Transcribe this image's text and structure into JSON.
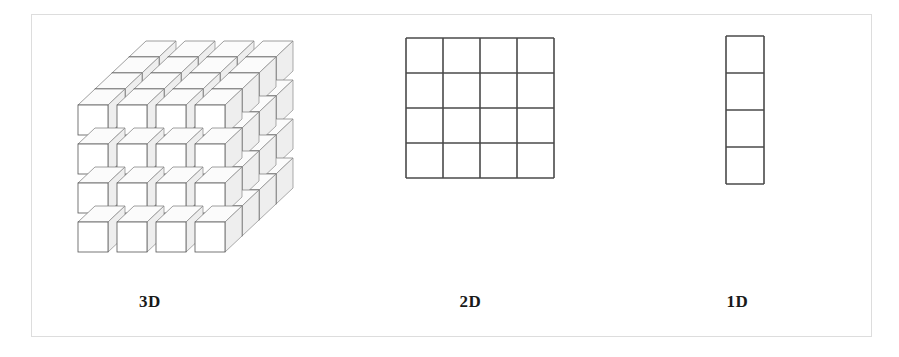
{
  "figure": {
    "background_color": "#ffffff",
    "frame": {
      "name": "outer-border",
      "color": "#dddddd",
      "x": 31,
      "y": 14,
      "width": 841,
      "height": 323
    },
    "panels": [
      {
        "id": "3d",
        "caption": "3D",
        "shape": "cube-array",
        "dims": [
          4,
          4,
          4
        ],
        "cell_count": 64,
        "stroke_color": "#555555",
        "fill_color": "#ffffff"
      },
      {
        "id": "2d",
        "caption": "2D",
        "shape": "grid",
        "dims": [
          4,
          4
        ],
        "cell_count": 16,
        "stroke_color": "#4a4a4a",
        "fill_color": "#ffffff"
      },
      {
        "id": "1d",
        "caption": "1D",
        "shape": "column",
        "dims": [
          4,
          1
        ],
        "cell_count": 4,
        "stroke_color": "#4a4a4a",
        "fill_color": "#ffffff"
      }
    ]
  },
  "chart_data": {
    "type": "diagram",
    "title": "",
    "categories": [
      "3D",
      "2D",
      "1D"
    ],
    "values": [
      64,
      16,
      4
    ],
    "series": [
      {
        "name": "element count",
        "values": [
          64,
          16,
          4
        ]
      },
      {
        "name": "dimensionality",
        "values": [
          3,
          2,
          1
        ]
      }
    ],
    "annotations": [
      "3D",
      "2D",
      "1D"
    ],
    "legend": "none",
    "grid": false,
    "xlabel": "",
    "ylabel": ""
  }
}
